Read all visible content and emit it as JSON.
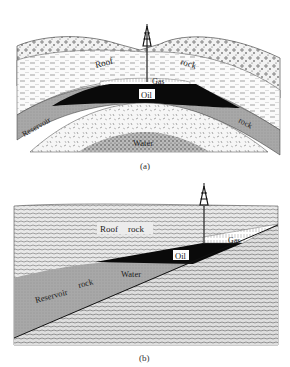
{
  "figure_a": {
    "caption": "(a)",
    "title": "Anticline oil trap",
    "labels": {
      "roof": "Roof",
      "rock_top": "rock",
      "gas": "Gas",
      "oil": "Oil",
      "reservoir": "Reservoir",
      "rock_bottom": "rock",
      "water": "Water"
    }
  },
  "figure_b": {
    "caption": "(b)",
    "title": "Stratigraphic / wedge oil trap",
    "labels": {
      "roof": "Roof",
      "roof_rock": "rock",
      "gas": "Gas",
      "oil": "Oil",
      "water": "Water",
      "reservoir": "Reservoir",
      "reservoir_rock": "rock"
    }
  },
  "colors": {
    "background": "#ffffff",
    "oil": "#0a0a0a",
    "reservoir": "#a8a8a8",
    "ink": "#222222"
  }
}
